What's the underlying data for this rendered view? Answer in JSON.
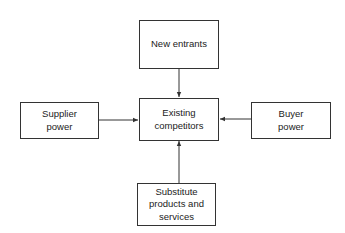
{
  "diagram": {
    "nodes": {
      "new_entrants": "New entrants",
      "existing_competitors": "Existing\ncompetitors",
      "supplier_power": "Supplier\npower",
      "buyer_power": "Buyer\npower",
      "substitutes": "Substitute\nproducts and\nservices"
    },
    "edges": [
      {
        "from": "new_entrants",
        "to": "existing_competitors"
      },
      {
        "from": "supplier_power",
        "to": "existing_competitors"
      },
      {
        "from": "buyer_power",
        "to": "existing_competitors"
      },
      {
        "from": "substitutes",
        "to": "existing_competitors"
      }
    ]
  }
}
